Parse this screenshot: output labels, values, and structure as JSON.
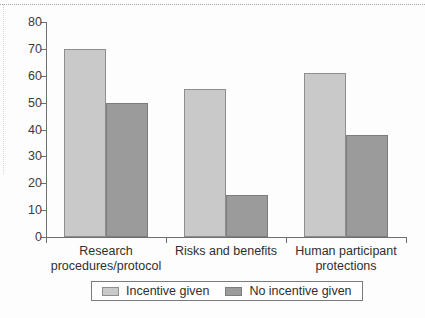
{
  "chart_data": {
    "type": "bar",
    "title": "",
    "subtitle": "",
    "xlabel": "",
    "ylabel": "",
    "ylim": [
      0,
      80
    ],
    "ytick_step": 10,
    "yticks": [
      0,
      10,
      20,
      30,
      40,
      50,
      60,
      70,
      80
    ],
    "ytick_labels": [
      "0",
      "10",
      "20",
      "30",
      "40",
      "50",
      "60",
      "70",
      "80"
    ],
    "grid": false,
    "legend_position": "bottom-center",
    "categories": [
      "Research\nprocedures/protocol",
      "Risks and benefits",
      "Human participant\nprotections"
    ],
    "series": [
      {
        "name": "Incentive given",
        "color": "#c9c9c9",
        "values": [
          70,
          55,
          61
        ]
      },
      {
        "name": "No incentive given",
        "color": "#9b9b9b",
        "values": [
          50,
          15.5,
          38
        ]
      }
    ]
  },
  "legend": {
    "items": [
      {
        "label": "Incentive given",
        "swatch": "light"
      },
      {
        "label": "No incentive given",
        "swatch": "dark"
      }
    ]
  },
  "colors": {
    "series_light": "#c9c9c9",
    "series_dark": "#9b9b9b",
    "axis": "#6f6f6f",
    "text": "#2f2f2f",
    "background": "#fdfdfd"
  }
}
